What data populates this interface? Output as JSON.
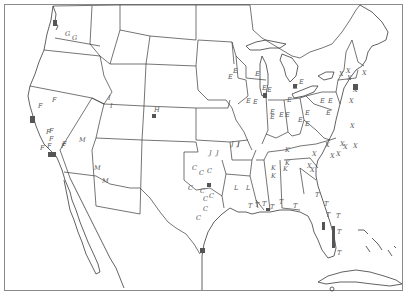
{
  "map": {
    "title": "",
    "region": "Contiguous United States",
    "frame": {
      "x": 4,
      "y": 4,
      "width": 399,
      "height": 287
    },
    "colors": {
      "border": "#3a3a3a",
      "marker": "#555555",
      "frame": "#8a8a8a",
      "background": "#ffffff"
    },
    "legend": [],
    "cluster_labels": [
      "C",
      "E",
      "F",
      "G",
      "H",
      "I",
      "J",
      "K",
      "L",
      "M",
      "T",
      "X"
    ],
    "markers": [
      {
        "label": "G",
        "x": 65,
        "y": 36
      },
      {
        "label": "G",
        "x": 72,
        "y": 40
      },
      {
        "label": "F",
        "x": 52,
        "y": 102
      },
      {
        "label": "F",
        "x": 38,
        "y": 108
      },
      {
        "label": "F",
        "x": 46,
        "y": 134
      },
      {
        "label": "F",
        "x": 49,
        "y": 141
      },
      {
        "label": "F",
        "x": 47,
        "y": 148
      },
      {
        "label": "F",
        "x": 61,
        "y": 148
      },
      {
        "label": "F",
        "x": 62,
        "y": 146
      },
      {
        "label": "F",
        "x": 49,
        "y": 133
      },
      {
        "label": "F",
        "x": 40,
        "y": 150
      },
      {
        "label": "I",
        "x": 108,
        "y": 100
      },
      {
        "label": "I",
        "x": 110,
        "y": 108
      },
      {
        "label": "M",
        "x": 94,
        "y": 170
      },
      {
        "label": "M",
        "x": 102,
        "y": 183
      },
      {
        "label": "M",
        "x": 79,
        "y": 142
      },
      {
        "label": "H",
        "x": 154,
        "y": 112
      },
      {
        "label": "J",
        "x": 209,
        "y": 155
      },
      {
        "label": "J",
        "x": 216,
        "y": 155
      },
      {
        "label": "J",
        "x": 231,
        "y": 146
      },
      {
        "label": "J",
        "x": 237,
        "y": 146
      },
      {
        "label": "C",
        "x": 192,
        "y": 170
      },
      {
        "label": "C",
        "x": 199,
        "y": 175
      },
      {
        "label": "C",
        "x": 207,
        "y": 173
      },
      {
        "label": "C",
        "x": 188,
        "y": 190
      },
      {
        "label": "C",
        "x": 200,
        "y": 193
      },
      {
        "label": "C",
        "x": 203,
        "y": 201
      },
      {
        "label": "C",
        "x": 209,
        "y": 198
      },
      {
        "label": "C",
        "x": 203,
        "y": 211
      },
      {
        "label": "C",
        "x": 196,
        "y": 220
      },
      {
        "label": "L",
        "x": 234,
        "y": 190
      },
      {
        "label": "L",
        "x": 246,
        "y": 190
      },
      {
        "label": "E",
        "x": 233,
        "y": 73
      },
      {
        "label": "E",
        "x": 228,
        "y": 79
      },
      {
        "label": "E",
        "x": 255,
        "y": 76
      },
      {
        "label": "E",
        "x": 262,
        "y": 90
      },
      {
        "label": "E",
        "x": 267,
        "y": 92
      },
      {
        "label": "E",
        "x": 246,
        "y": 103
      },
      {
        "label": "E",
        "x": 253,
        "y": 104
      },
      {
        "label": "E",
        "x": 270,
        "y": 114
      },
      {
        "label": "E",
        "x": 270,
        "y": 119
      },
      {
        "label": "E",
        "x": 279,
        "y": 117
      },
      {
        "label": "E",
        "x": 285,
        "y": 117
      },
      {
        "label": "E",
        "x": 293,
        "y": 89
      },
      {
        "label": "E",
        "x": 299,
        "y": 84
      },
      {
        "label": "E",
        "x": 305,
        "y": 115
      },
      {
        "label": "E",
        "x": 298,
        "y": 122
      },
      {
        "label": "E",
        "x": 287,
        "y": 102
      },
      {
        "label": "E",
        "x": 320,
        "y": 103
      },
      {
        "label": "E",
        "x": 326,
        "y": 115
      },
      {
        "label": "E",
        "x": 328,
        "y": 103
      },
      {
        "label": "E",
        "x": 305,
        "y": 126
      },
      {
        "label": "I",
        "x": 237,
        "y": 147
      },
      {
        "label": "K",
        "x": 285,
        "y": 152
      },
      {
        "label": "K",
        "x": 283,
        "y": 171
      },
      {
        "label": "K",
        "x": 271,
        "y": 170
      },
      {
        "label": "K",
        "x": 271,
        "y": 178
      },
      {
        "label": "K",
        "x": 285,
        "y": 165
      },
      {
        "label": "T",
        "x": 248,
        "y": 208
      },
      {
        "label": "T",
        "x": 255,
        "y": 207
      },
      {
        "label": "T",
        "x": 262,
        "y": 206
      },
      {
        "label": "T",
        "x": 270,
        "y": 209
      },
      {
        "label": "T",
        "x": 279,
        "y": 204
      },
      {
        "label": "T",
        "x": 293,
        "y": 208
      },
      {
        "label": "T",
        "x": 315,
        "y": 197
      },
      {
        "label": "T",
        "x": 324,
        "y": 206
      },
      {
        "label": "T",
        "x": 326,
        "y": 217
      },
      {
        "label": "T",
        "x": 336,
        "y": 218
      },
      {
        "label": "T",
        "x": 337,
        "y": 234
      },
      {
        "label": "T",
        "x": 337,
        "y": 255
      },
      {
        "label": "X",
        "x": 339,
        "y": 76
      },
      {
        "label": "X",
        "x": 346,
        "y": 73
      },
      {
        "label": "X",
        "x": 347,
        "y": 80
      },
      {
        "label": "X",
        "x": 362,
        "y": 75
      },
      {
        "label": "X",
        "x": 353,
        "y": 92
      },
      {
        "label": "X",
        "x": 349,
        "y": 103
      },
      {
        "label": "X",
        "x": 350,
        "y": 128
      },
      {
        "label": "X",
        "x": 325,
        "y": 147
      },
      {
        "label": "X",
        "x": 340,
        "y": 146
      },
      {
        "label": "X",
        "x": 343,
        "y": 149
      },
      {
        "label": "X",
        "x": 353,
        "y": 148
      },
      {
        "label": "X",
        "x": 312,
        "y": 156
      },
      {
        "label": "X",
        "x": 330,
        "y": 158
      },
      {
        "label": "X",
        "x": 307,
        "y": 168
      },
      {
        "label": "X",
        "x": 310,
        "y": 172
      },
      {
        "label": "X",
        "x": 336,
        "y": 156
      }
    ]
  }
}
